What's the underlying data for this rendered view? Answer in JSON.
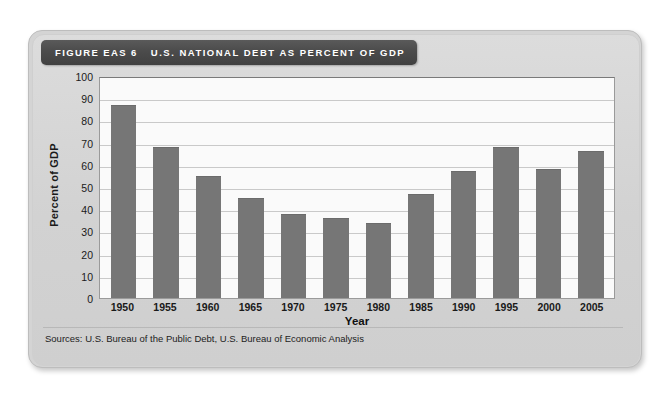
{
  "figure": {
    "number_label": "FIGURE EAS 6",
    "title": "U.S. NATIONAL DEBT AS PERCENT OF GDP",
    "source": "Sources: U.S. Bureau of the Public Debt, U.S. Bureau of Economic Analysis"
  },
  "colors": {
    "bar": "#767676",
    "banner": "#4b4b4b",
    "card": "#d4d4d4",
    "plot_background": "#fafafa",
    "gridline": "#c9c9c9",
    "text": "#1a1a1a"
  },
  "chart_data": {
    "type": "bar",
    "title": "U.S. NATIONAL DEBT AS PERCENT OF GDP",
    "xlabel": "Year",
    "ylabel": "Percent of GDP",
    "categories": [
      "1950",
      "1955",
      "1960",
      "1965",
      "1970",
      "1975",
      "1980",
      "1985",
      "1990",
      "1995",
      "2000",
      "2005"
    ],
    "values": [
      87,
      68,
      55,
      45,
      38,
      36,
      34,
      47,
      57,
      68,
      58,
      66
    ],
    "ylim": [
      0,
      100
    ],
    "yticks": [
      100,
      90,
      80,
      70,
      60,
      50,
      40,
      30,
      20,
      10,
      0
    ],
    "ytick_step": 10,
    "grid": true,
    "legend": null,
    "source": "Sources: U.S. Bureau of the Public Debt, U.S. Bureau of Economic Analysis"
  }
}
